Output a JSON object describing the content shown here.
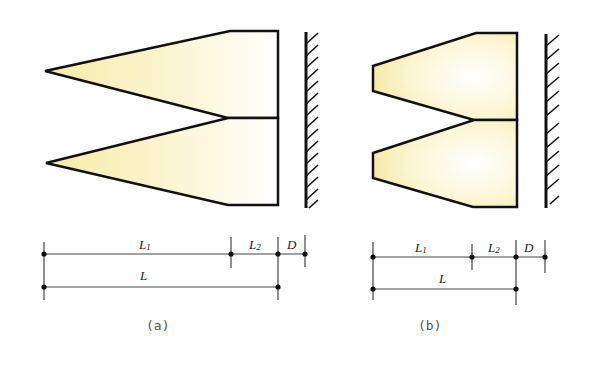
{
  "figure": {
    "panels": [
      {
        "id": "a",
        "caption": "(a)",
        "description": "Two pointed conical charges stacked vertically in front of a hatched wall",
        "tip_style": "pointed",
        "labels": {
          "L1_main": "L",
          "L1_sub": "1",
          "L2_main": "L",
          "L2_sub": "2",
          "D": "D",
          "L": "L"
        }
      },
      {
        "id": "b",
        "caption": "(b)",
        "description": "Two truncated (flat-tipped) conical charges stacked vertically in front of a hatched wall",
        "tip_style": "truncated",
        "labels": {
          "L1_main": "L",
          "L1_sub": "1",
          "L2_main": "L",
          "L2_sub": "2",
          "D": "D",
          "L": "L"
        }
      }
    ],
    "colors": {
      "fill_yellow": "#f8f0b8",
      "fill_white": "#ffffff",
      "stroke": "#111111",
      "dim_line": "#444444"
    }
  }
}
